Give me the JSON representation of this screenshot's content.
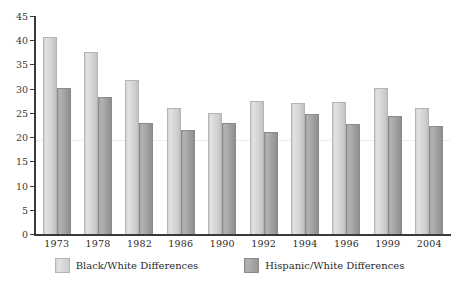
{
  "chart_data": {
    "type": "bar",
    "title": "",
    "xlabel": "",
    "ylabel": "",
    "ylim": [
      0,
      45
    ],
    "yticks": [
      0,
      5,
      10,
      15,
      20,
      25,
      30,
      35,
      40,
      45
    ],
    "grid": false,
    "legend_position": "bottom",
    "categories": [
      "1973",
      "1978",
      "1982",
      "1986",
      "1990",
      "1992",
      "1994",
      "1996",
      "1999",
      "2004"
    ],
    "series": [
      {
        "name": "Black/White Differences",
        "color": "#d6d6d6",
        "values": [
          40.7,
          37.5,
          31.8,
          26.0,
          25.0,
          27.5,
          27.0,
          27.2,
          30.2,
          26.0
        ]
      },
      {
        "name": "Hispanic/White Differences",
        "color": "#a3a3a3",
        "values": [
          30.2,
          28.3,
          23.0,
          21.5,
          23.0,
          21.0,
          24.7,
          22.8,
          24.3,
          22.2
        ]
      }
    ]
  },
  "legend": {
    "items": [
      {
        "label": "Black/White Differences",
        "swatch": "light"
      },
      {
        "label": "Hispanic/White Differences",
        "swatch": "dark"
      }
    ]
  }
}
